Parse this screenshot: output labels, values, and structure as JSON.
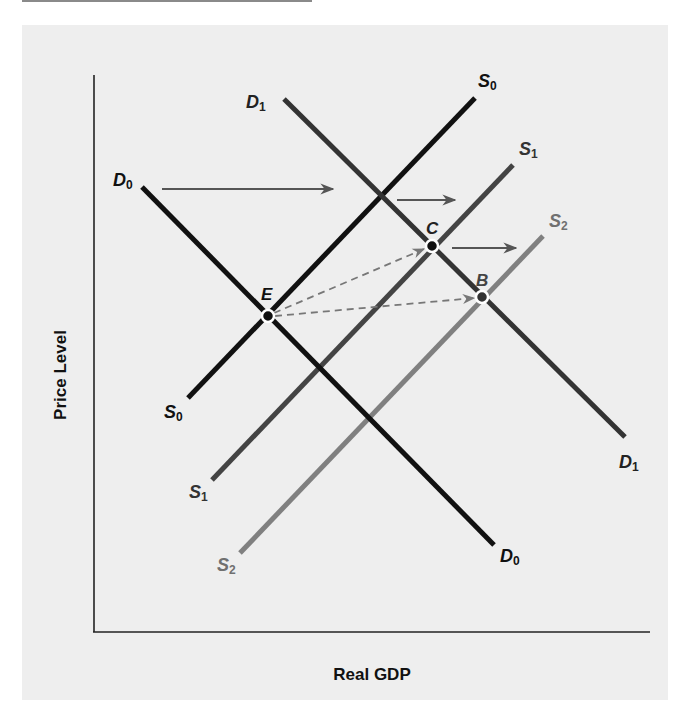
{
  "figure": {
    "x_axis_label": "Real GDP",
    "y_axis_label": "Price Level",
    "colors": {
      "panel_background": "#eeeeee",
      "axis": "#222222",
      "S0": "#111111",
      "S1": "#444444",
      "S2": "#808080",
      "D0": "#111111",
      "D1": "#333333",
      "shift_arrow": "#555555",
      "dashed_arrow": "#777777"
    },
    "curves": [
      {
        "id": "S0",
        "letter": "S",
        "sub": "0",
        "type": "supply",
        "from": [
          188,
          398
        ],
        "to": [
          475,
          98
        ]
      },
      {
        "id": "S1",
        "letter": "S",
        "sub": "1",
        "type": "supply",
        "from": [
          212,
          480
        ],
        "to": [
          513,
          165
        ]
      },
      {
        "id": "S2",
        "letter": "S",
        "sub": "2",
        "type": "supply",
        "from": [
          240,
          553
        ],
        "to": [
          543,
          236
        ]
      },
      {
        "id": "D0",
        "letter": "D",
        "sub": "0",
        "type": "demand",
        "from": [
          142,
          187
        ],
        "to": [
          494,
          545
        ]
      },
      {
        "id": "D1",
        "letter": "D",
        "sub": "1",
        "type": "demand",
        "from": [
          284,
          99
        ],
        "to": [
          625,
          437
        ]
      }
    ],
    "points": [
      {
        "id": "E",
        "label": "E",
        "x": 268,
        "y": 316
      },
      {
        "id": "C",
        "label": "C",
        "x": 432,
        "y": 246
      },
      {
        "id": "B",
        "label": "B",
        "x": 482,
        "y": 297
      }
    ],
    "shift_arrows": [
      {
        "from": [
          162,
          189
        ],
        "to": [
          334,
          189
        ],
        "meaning": "demand shifts from D0 to D1"
      },
      {
        "from": [
          397,
          200
        ],
        "to": [
          456,
          200
        ],
        "meaning": "supply shifts from S0 to S1"
      },
      {
        "from": [
          452,
          248
        ],
        "to": [
          517,
          248
        ],
        "meaning": "supply shifts from S1 to S2"
      }
    ],
    "dashed_arrows": [
      {
        "from": "E",
        "to": "C"
      },
      {
        "from": "E",
        "to": "B"
      }
    ]
  }
}
